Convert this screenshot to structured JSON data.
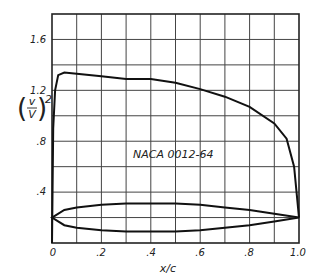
{
  "chart_data": {
    "type": "line",
    "title": "",
    "annotation": "NACA 0012-64",
    "xlabel": "x/c",
    "ylabel": "(v/V)^2",
    "xlim": [
      0,
      1.0
    ],
    "ylim": [
      0,
      1.8
    ],
    "grid": true,
    "x_ticks": [
      "0",
      ".2",
      ".4",
      ".6",
      ".8",
      "1.0"
    ],
    "y_ticks": [
      ".4",
      ".8",
      "1.2",
      "1.6"
    ],
    "series": [
      {
        "name": "velocity distribution (v/V)^2",
        "x": [
          0,
          0.005,
          0.0125,
          0.025,
          0.05,
          0.1,
          0.2,
          0.3,
          0.4,
          0.5,
          0.6,
          0.7,
          0.8,
          0.9,
          0.95,
          0.98,
          1.0
        ],
        "y": [
          0,
          0.9,
          1.2,
          1.32,
          1.34,
          1.33,
          1.31,
          1.29,
          1.29,
          1.26,
          1.21,
          1.15,
          1.07,
          0.94,
          0.82,
          0.6,
          0.2
        ]
      },
      {
        "name": "airfoil profile (schematic)",
        "x": [
          0,
          0.05,
          0.1,
          0.2,
          0.3,
          0.4,
          0.5,
          0.6,
          0.7,
          0.8,
          0.9,
          1.0
        ],
        "y_upper": [
          0.2,
          0.26,
          0.28,
          0.3,
          0.31,
          0.31,
          0.31,
          0.3,
          0.28,
          0.26,
          0.23,
          0.2
        ],
        "y_lower": [
          0.2,
          0.14,
          0.12,
          0.1,
          0.09,
          0.09,
          0.09,
          0.1,
          0.12,
          0.14,
          0.17,
          0.2
        ]
      }
    ]
  },
  "labels": {
    "annotation": "NACA 0012-64",
    "xlabel": "x/c",
    "ylabel_num": "v",
    "ylabel_den": "V",
    "ylabel_exp": "2",
    "x_ticks": [
      "0",
      ".2",
      ".4",
      ".6",
      ".8",
      "1.0"
    ],
    "y_ticks": [
      ".4",
      ".8",
      "1.2",
      "1.6"
    ]
  }
}
